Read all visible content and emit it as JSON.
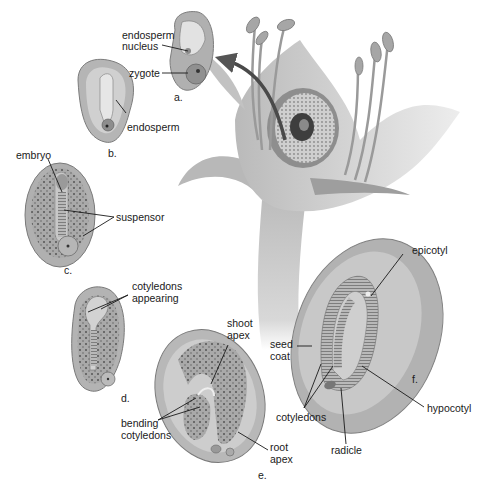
{
  "diagram": {
    "colors": {
      "background": "#ffffff",
      "tissue_light": "#c9c9c9",
      "tissue_mid": "#a8a8a8",
      "tissue_dark": "#7c7c7c",
      "leader_line": "#1a1a1a",
      "arrow": "#555555"
    },
    "stages": [
      {
        "id": "a",
        "label": "a.",
        "annotations": [
          "endosperm nucleus",
          "zygote"
        ]
      },
      {
        "id": "b",
        "label": "b.",
        "annotations": [
          "endosperm"
        ]
      },
      {
        "id": "c",
        "label": "c.",
        "annotations": [
          "embryo",
          "suspensor"
        ]
      },
      {
        "id": "d",
        "label": "d.",
        "annotations": [
          "cotyledons appearing"
        ]
      },
      {
        "id": "e",
        "label": "e.",
        "annotations": [
          "shoot apex",
          "bending cotyledons",
          "root apex"
        ]
      },
      {
        "id": "f",
        "label": "f.",
        "annotations": [
          "epicotyl",
          "seed coat",
          "cotyledons",
          "radicle",
          "hypocotyl"
        ]
      }
    ],
    "labels": {
      "endosperm_nucleus_1": "endosperm",
      "endosperm_nucleus_2": "nucleus",
      "zygote": "zygote",
      "endosperm": "endosperm",
      "embryo": "embryo",
      "suspensor": "suspensor",
      "cotyledons_appearing_1": "cotyledons",
      "cotyledons_appearing_2": "appearing",
      "shoot_apex_1": "shoot",
      "shoot_apex_2": "apex",
      "bending_cotyledons_1": "bending",
      "bending_cotyledons_2": "cotyledons",
      "root_apex_1": "root",
      "root_apex_2": "apex",
      "epicotyl": "epicotyl",
      "seed_coat_1": "seed",
      "seed_coat_2": "coat",
      "cotyledons": "cotyledons",
      "radicle": "radicle",
      "hypocotyl": "hypocotyl"
    }
  }
}
